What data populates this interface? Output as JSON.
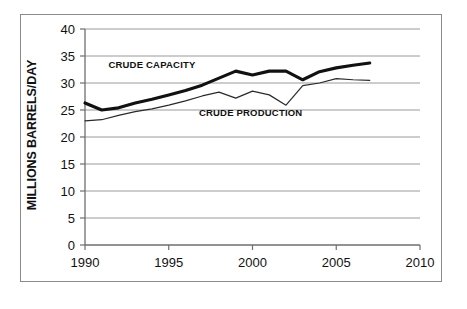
{
  "figure": {
    "background_color": "#ffffff",
    "border_color": "#8a8a8a"
  },
  "chart_data": {
    "type": "line",
    "title": "",
    "subtitle": "",
    "xlabel": "",
    "ylabel": "MILLIONS BARRELS/DAY",
    "xlim": [
      1990,
      2010
    ],
    "ylim": [
      0,
      40
    ],
    "grid": true,
    "grid_axis": "y",
    "legend_position": "inline-annotation",
    "x_ticks": [
      1990,
      1995,
      2000,
      2005,
      2010
    ],
    "x_tick_labels": [
      "1990",
      "1995",
      "2000",
      "2005",
      "2010"
    ],
    "y_ticks": [
      0,
      5,
      10,
      15,
      20,
      25,
      30,
      35,
      40
    ],
    "y_tick_labels": [
      "0",
      "5",
      "10",
      "15",
      "20",
      "25",
      "30",
      "35",
      "40"
    ],
    "x": [
      1990,
      1991,
      1992,
      1993,
      1994,
      1995,
      1996,
      1997,
      1998,
      1999,
      2000,
      2001,
      2002,
      2003,
      2004,
      2005,
      2006,
      2007
    ],
    "series": [
      {
        "name": "CRUDE CAPACITY",
        "color": "#111111",
        "line_width": 3.1,
        "values": [
          26.3,
          25.0,
          25.4,
          26.3,
          27.0,
          27.8,
          28.6,
          29.6,
          30.9,
          32.2,
          31.5,
          32.2,
          32.2,
          30.6,
          32.1,
          32.8,
          33.3,
          33.7
        ]
      },
      {
        "name": "CRUDE PRODUCTION",
        "color": "#2a2a2a",
        "line_width": 1.2,
        "values": [
          23.0,
          23.2,
          24.0,
          24.7,
          25.2,
          25.9,
          26.7,
          27.6,
          28.3,
          27.2,
          28.5,
          27.8,
          25.9,
          29.5,
          30.0,
          30.8,
          30.6,
          30.5
        ]
      }
    ],
    "annotations": [
      {
        "text": "CRUDE CAPACITY",
        "x": 1991.4,
        "y": 32.8,
        "series": "CRUDE CAPACITY"
      },
      {
        "text": "CRUDE PRODUCTION",
        "x": 1996.8,
        "y": 23.8,
        "series": "CRUDE PRODUCTION"
      }
    ]
  }
}
